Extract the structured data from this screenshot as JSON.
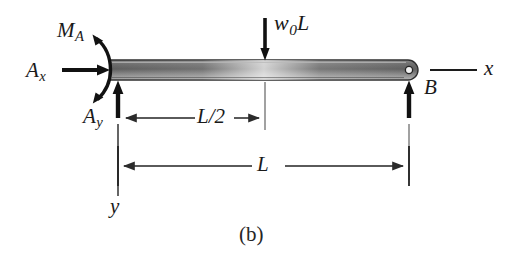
{
  "figure": {
    "caption": "(b)",
    "type": "free-body-diagram"
  },
  "labels": {
    "moment_a": {
      "base": "M",
      "sub": "A"
    },
    "reaction_ax": {
      "base": "A",
      "sub": "x"
    },
    "reaction_ay": {
      "base": "A",
      "sub": "y"
    },
    "load": {
      "base": "w",
      "sub": "0",
      "suffix": "L"
    },
    "point_b": "B",
    "axis_x": "x",
    "axis_y": "y",
    "dim_half": "L/2",
    "dim_full": "L"
  },
  "colors": {
    "ink": "#1a1a1a",
    "beam_dark": "#5a5a5a",
    "beam_light": "#dcdcdc",
    "beam_outline": "#3a3a3a",
    "dimension_line": "#2b2b2b",
    "extension_line": "#8a8a8a"
  },
  "geometry": {
    "beam_left_x": 110,
    "beam_right_x": 418,
    "beam_top_y": 60,
    "beam_bottom_y": 80,
    "midspan_x": 265,
    "support_a_x": 118,
    "support_b_x": 409
  }
}
